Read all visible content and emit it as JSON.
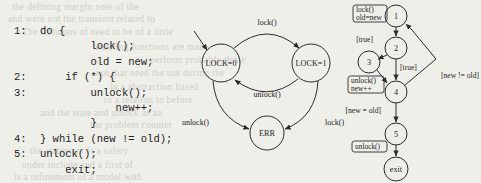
{
  "figure": {
    "background_color": "#efefe9",
    "ink_color": "#242424"
  },
  "code_panel": {
    "name": "source-code-listing",
    "lines": [
      {
        "label": "1:",
        "text": "do {"
      },
      {
        "label": "",
        "text": "        lock();"
      },
      {
        "label": "",
        "text": "        old = new;"
      },
      {
        "label": "2:",
        "text": "    if (*) {"
      },
      {
        "label": "3:",
        "text": "        unlock();"
      },
      {
        "label": "",
        "text": "            new++;"
      },
      {
        "label": "",
        "text": "        }"
      },
      {
        "label": "4:",
        "text": "} while (new != old);"
      },
      {
        "label": "5:",
        "text": "unlock();"
      },
      {
        "label": "",
        "text": "    exit;"
      }
    ]
  },
  "state_machine": {
    "name": "lock-state-machine",
    "nodes": [
      {
        "id": "lock0",
        "label": "LOCK=0",
        "cx": 221,
        "cy": 63,
        "r": 19
      },
      {
        "id": "lock1",
        "label": "LOCK=1",
        "cx": 311,
        "cy": 63,
        "r": 19
      },
      {
        "id": "err",
        "label": "ERR",
        "cx": 267,
        "cy": 133,
        "r": 17
      }
    ],
    "edges": [
      {
        "from": "lock0",
        "to": "lock1",
        "label": "lock()"
      },
      {
        "from": "lock1",
        "to": "lock0",
        "label": "unlock()"
      },
      {
        "from": "lock0",
        "to": "err",
        "label": "unlock()"
      },
      {
        "from": "lock1",
        "to": "err",
        "label": "lock()"
      }
    ],
    "entry_arrow": true
  },
  "cfg_panel": {
    "name": "control-flow-graph",
    "nodes": [
      {
        "id": "n1",
        "label": "1",
        "cx": 396,
        "cy": 16,
        "r": 11
      },
      {
        "id": "n2",
        "label": "2",
        "cx": 396,
        "cy": 48,
        "r": 11
      },
      {
        "id": "n3",
        "label": "3",
        "cx": 369,
        "cy": 62,
        "r": 11
      },
      {
        "id": "n4",
        "label": "4",
        "cx": 396,
        "cy": 92,
        "r": 11
      },
      {
        "id": "n5",
        "label": "5",
        "cx": 396,
        "cy": 134,
        "r": 11
      },
      {
        "id": "nx",
        "label": "exit",
        "cx": 396,
        "cy": 169,
        "r": 12
      }
    ],
    "action_boxes": [
      {
        "id": "b1",
        "lines": [
          "lock()",
          "old=new"
        ],
        "x": 353,
        "y": 11
      },
      {
        "id": "b2",
        "lines": [
          "unlock()",
          "new++"
        ],
        "x": 351,
        "y": 74
      },
      {
        "id": "b3",
        "lines": [
          "unlock()"
        ],
        "x": 355,
        "y": 146
      }
    ],
    "edge_labels": [
      {
        "id": "e_true_left",
        "text": "[true]",
        "x": 357,
        "y": 43
      },
      {
        "id": "e_true_down",
        "text": "[true]",
        "x": 400,
        "y": 68
      },
      {
        "id": "e_new_ne_old",
        "text": "[new != old]",
        "x": 425,
        "y": 76
      },
      {
        "id": "e_new_eq_old",
        "text": "[new = old]",
        "x": 352,
        "y": 110
      }
    ]
  },
  "ghost_text": [
    {
      "text": "the defining margin note of the",
      "x": 12,
      "y": 2
    },
    {
      "text": "and were not the transient related to",
      "x": 8,
      "y": 14
    },
    {
      "text": "The Columns of need to be of a little",
      "x": 22,
      "y": 27
    },
    {
      "text": "existing functions are made",
      "x": 96,
      "y": 42
    },
    {
      "text": "perform probably those",
      "x": 150,
      "y": 55
    },
    {
      "text": "not that need the use during the",
      "x": 96,
      "y": 68
    },
    {
      "text": "in a abstraction based",
      "x": 110,
      "y": 82
    },
    {
      "text": "to a relation to before",
      "x": 104,
      "y": 95
    },
    {
      "text": "and the state and unlock as an",
      "x": 40,
      "y": 108
    },
    {
      "text": "the problem counter",
      "x": 90,
      "y": 120
    },
    {
      "text": "the statement is a safety",
      "x": 30,
      "y": 146
    },
    {
      "text": "under include and a first of",
      "x": 22,
      "y": 160
    },
    {
      "text": "is a refinement of a model with",
      "x": 14,
      "y": 172
    }
  ]
}
